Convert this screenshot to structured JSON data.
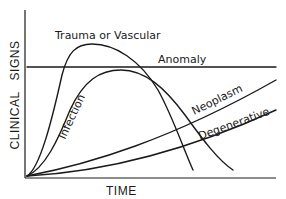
{
  "diagram": {
    "y_axis_label": "CLINICAL   SIGNS",
    "x_axis_label": "TIME",
    "curves": [
      {
        "id": "trauma",
        "label": "Trauma or Vascular"
      },
      {
        "id": "anomaly",
        "label": "Anomaly"
      },
      {
        "id": "infection",
        "label": "Infection"
      },
      {
        "id": "neoplasm",
        "label": "Neoplasm"
      },
      {
        "id": "degenerative",
        "label": "Degenerative"
      }
    ]
  },
  "labels": {
    "trauma": "Trauma or Vascular",
    "anomaly": "Anomaly",
    "infection": "Infection",
    "neoplasm": "Neoplasm",
    "degenerative": "Degenerative",
    "xaxis": "TIME",
    "yaxis": "CLINICAL   SIGNS"
  },
  "colors": {
    "line": "#1a1a1a",
    "background": "#ffffff"
  }
}
